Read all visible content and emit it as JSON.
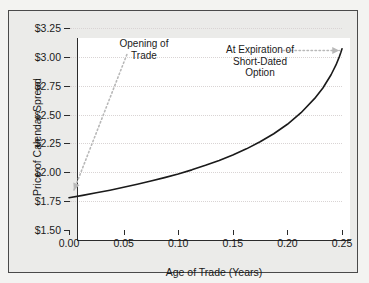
{
  "chart_data": {
    "type": "line",
    "title": "",
    "xlabel": "Age of Trade (Years)",
    "ylabel": "Price of Calendar Spread",
    "xlim": [
      0.0,
      0.25
    ],
    "ylim": [
      1.5,
      3.25
    ],
    "grid": true,
    "legend": null,
    "x_ticks": [
      "0.00",
      "0.05",
      "0.10",
      "0.15",
      "0.20",
      "0.25"
    ],
    "x_tick_values": [
      0.0,
      0.05,
      0.1,
      0.15,
      0.2,
      0.25
    ],
    "y_ticks": [
      "$1.50",
      "$1.75",
      "$2.00",
      "$2.25",
      "$2.50",
      "$2.75",
      "$3.00",
      "$3.25"
    ],
    "y_tick_values": [
      1.5,
      1.75,
      2.0,
      2.25,
      2.5,
      2.75,
      3.0,
      3.25
    ],
    "series": [
      {
        "name": "Price of Calendar Spread",
        "color": "#1a1a1a",
        "x": [
          0.0,
          0.0125,
          0.025,
          0.0375,
          0.05,
          0.0625,
          0.075,
          0.0875,
          0.1,
          0.1125,
          0.125,
          0.1375,
          0.15,
          0.1625,
          0.175,
          0.1875,
          0.2,
          0.2125,
          0.225,
          0.2325,
          0.24,
          0.2445,
          0.2475,
          0.249,
          0.25
        ],
        "y": [
          1.78,
          1.8,
          1.822,
          1.845,
          1.87,
          1.896,
          1.924,
          1.954,
          1.986,
          2.021,
          2.06,
          2.103,
          2.15,
          2.203,
          2.264,
          2.334,
          2.416,
          2.516,
          2.64,
          2.73,
          2.845,
          2.93,
          3.0,
          3.04,
          3.07
        ]
      }
    ],
    "annotations": [
      {
        "name": "opening-of-trade",
        "text": "Opening of\nTrade",
        "arrow": "dotted-arrow-down-left",
        "points_to_x": 0.0,
        "points_to_y": 1.8
      },
      {
        "name": "at-expiration-of-short-dated-option",
        "text": "At Expiration of\nShort-Dated\nOption",
        "arrow": "dotted-arrow-right",
        "points_to_x": 0.25,
        "points_to_y": 3.07
      }
    ]
  },
  "axes": {
    "x_title": "Age of Trade (Years)",
    "y_title": "Price of Calendar Spread",
    "x_tick_labels": [
      "0.00",
      "0.05",
      "0.10",
      "0.15",
      "0.20",
      "0.25"
    ],
    "y_tick_labels": [
      "$3.25",
      "$3.00",
      "$2.75",
      "$2.50",
      "$2.25",
      "$2.00",
      "$1.75",
      "$1.50"
    ]
  },
  "annotations": {
    "opening": "Opening of\nTrade",
    "expiration": "At Expiration of\nShort-Dated\nOption"
  },
  "colors": {
    "curve": "#1a1a1a",
    "axis": "#2b2b2b",
    "gridline": "#d9d4d4",
    "arrow": "#b8b8b8",
    "plot_background": "#ffffff",
    "figure_background": "#ebebe9",
    "page_background": "#f3f3f1"
  }
}
